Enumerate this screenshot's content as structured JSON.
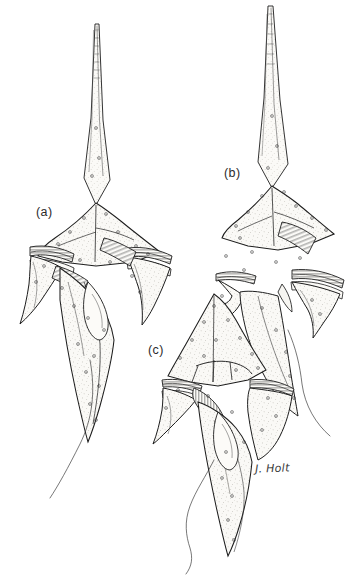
{
  "plate": {
    "title": "Dinoflagellate specimens line drawing",
    "background_color": "#ffffff",
    "ink_color": "#1d1d1d",
    "fill_color": "#f7f6f2",
    "medium": "pen-and-ink stipple scientific illustration",
    "width": 360,
    "height": 581
  },
  "labels": {
    "a": "(a)",
    "b": "(b)",
    "c": "(c)"
  },
  "signature": {
    "text": "J. Holt"
  },
  "specimens": [
    {
      "id": "a",
      "label": "(a)",
      "label_position": {
        "x": 36,
        "y": 205
      },
      "orientation": "ventral view, apical horn upward",
      "features": [
        "long tapered striated apical horn",
        "stippled epitheca with scattered pores",
        "transverse cingulum with striated girdle lists",
        "sulcus with longitudinal flagellum groove",
        "two lateral antapical spines",
        "elongate antapical spine",
        "trailing longitudinal flagellum"
      ],
      "flagellum_direction": "down-left"
    },
    {
      "id": "b",
      "label": "(b)",
      "label_position": {
        "x": 224,
        "y": 166
      },
      "orientation": "oblique lateral view, apical horn upward",
      "features": [
        "long tapered striated apical horn reaching top margin",
        "broad stippled hypotheca",
        "cingulum with flared girdle list",
        "lobed antapical margin",
        "short right antapical spine",
        "trailing longitudinal flagellum"
      ],
      "flagellum_direction": "down-right"
    },
    {
      "id": "c",
      "label": "(c)",
      "label_position": {
        "x": 148,
        "y": 343
      },
      "orientation": "ventral view, short apical region",
      "features": [
        "broad conical stippled epitheca without long horn",
        "prominent thecal plate sutures",
        "cingulum with striated lists",
        "striated sulcal plate",
        "left antapical spine",
        "long tapering antapical spine",
        "wavy trailing flagellum"
      ],
      "flagellum_direction": "down-left wavy"
    }
  ]
}
